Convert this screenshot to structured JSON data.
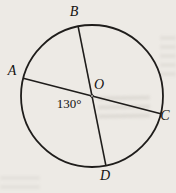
{
  "diagram": {
    "labels": {
      "A": "A",
      "B": "B",
      "C": "C",
      "D": "D",
      "O": "O"
    },
    "angle_label": "130°",
    "colors": {
      "line": "#1f1d1b",
      "text": "#141210",
      "background": "#edeae5"
    }
  }
}
